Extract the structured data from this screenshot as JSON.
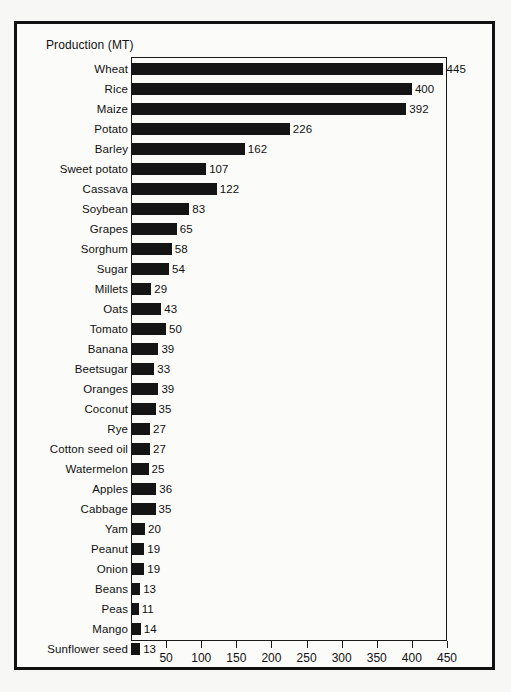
{
  "chart_data": {
    "type": "bar",
    "orientation": "horizontal",
    "title": "Production (MT)",
    "xlabel": "",
    "ylabel": "",
    "xlim": [
      0,
      450
    ],
    "xticks": [
      50,
      100,
      150,
      200,
      250,
      300,
      350,
      400,
      450
    ],
    "grid": false,
    "legend": null,
    "bar_color": "#141414",
    "categories": [
      "Wheat",
      "Rice",
      "Maize",
      "Potato",
      "Barley",
      "Sweet potato",
      "Cassava",
      "Soybean",
      "Grapes",
      "Sorghum",
      "Sugar",
      "Millets",
      "Oats",
      "Tomato",
      "Banana",
      "Beetsugar",
      "Oranges",
      "Coconut",
      "Rye",
      "Cotton seed oil",
      "Watermelon",
      "Apples",
      "Cabbage",
      "Yam",
      "Peanut",
      "Onion",
      "Beans",
      "Peas",
      "Mango",
      "Sunflower seed"
    ],
    "values": [
      445,
      400,
      392,
      226,
      162,
      107,
      122,
      83,
      65,
      58,
      54,
      29,
      43,
      50,
      39,
      33,
      39,
      35,
      27,
      27,
      25,
      36,
      35,
      20,
      19,
      19,
      13,
      11,
      14,
      13
    ]
  }
}
